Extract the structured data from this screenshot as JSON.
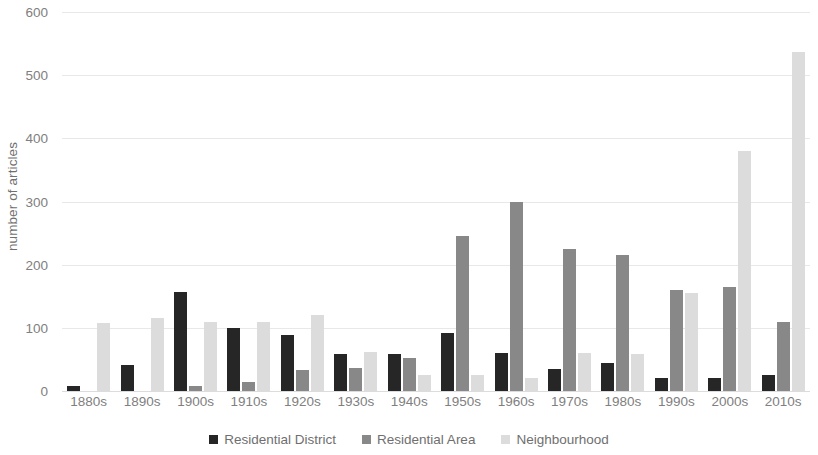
{
  "chart_data": {
    "type": "bar",
    "title": "",
    "subtitle": "",
    "xlabel": "",
    "ylabel": "number of articles",
    "ylim": [
      0,
      600
    ],
    "yticks": [
      0,
      100,
      200,
      300,
      400,
      500,
      600
    ],
    "grid": true,
    "legend_position": "bottom",
    "categories": [
      "1880s",
      "1890s",
      "1900s",
      "1910s",
      "1920s",
      "1930s",
      "1940s",
      "1950s",
      "1960s",
      "1970s",
      "1980s",
      "1990s",
      "2000s",
      "2010s"
    ],
    "series": [
      {
        "name": "Residential District",
        "color": "#262626",
        "values": [
          8,
          41,
          157,
          99,
          89,
          58,
          58,
          92,
          60,
          35,
          44,
          21,
          20,
          25
        ]
      },
      {
        "name": "Residential Area",
        "color": "#888888",
        "values": [
          0,
          0,
          8,
          15,
          33,
          36,
          52,
          245,
          300,
          225,
          216,
          160,
          165,
          110
        ]
      },
      {
        "name": "Neighbourhood",
        "color": "#dcdcdc",
        "values": [
          107,
          115,
          110,
          110,
          120,
          62,
          25,
          25,
          20,
          60,
          58,
          155,
          380,
          537
        ]
      }
    ]
  },
  "axis": {
    "y_title": "number of articles"
  },
  "colors": {
    "series_0": "#262626",
    "series_1": "#888888",
    "series_2": "#dcdcdc",
    "gridline": "#e8e8e8",
    "tick_text": "#808080",
    "background": "#ffffff"
  }
}
